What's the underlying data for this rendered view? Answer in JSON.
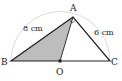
{
  "diagram": {
    "type": "geometry",
    "points": {
      "A": {
        "label": "A",
        "x": 73,
        "y": 17
      },
      "B": {
        "label": "B",
        "x": 11,
        "y": 61
      },
      "C": {
        "label": "C",
        "x": 110,
        "y": 61
      },
      "O": {
        "label": "O",
        "x": 60,
        "y": 61
      }
    },
    "lengths": {
      "AB": "8 cm",
      "AC": "6 cm"
    },
    "shaded_region": "triangle ABO",
    "right_angle_at": "A",
    "semicircle": {
      "center": "O",
      "diameter": "BC"
    },
    "colors": {
      "stroke": "#222222",
      "shade": "#bdbdbd",
      "arc": "#d0d0d0"
    }
  }
}
